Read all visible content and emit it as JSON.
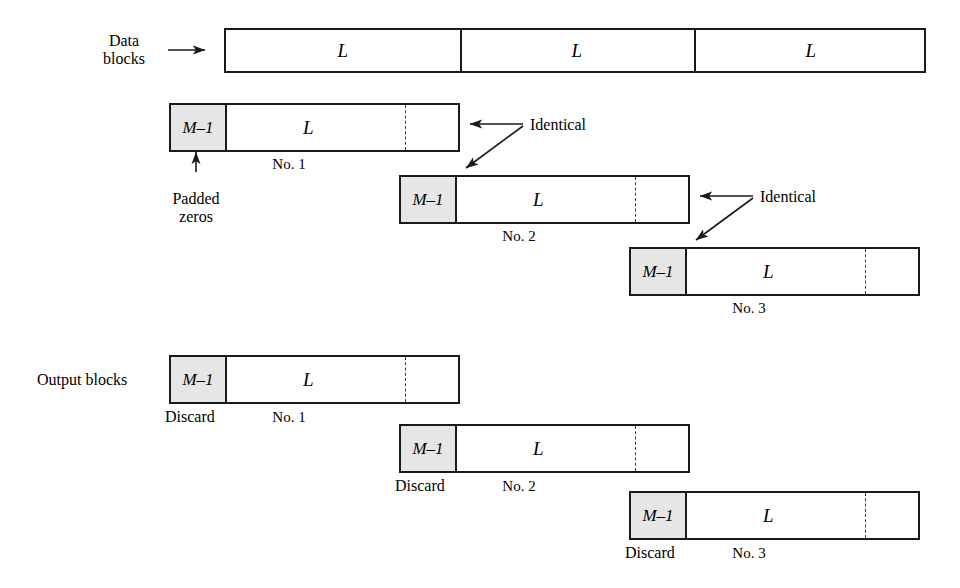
{
  "figure": {
    "labels": {
      "data_blocks": "Data\nblocks",
      "data_blocks_line1": "Data",
      "data_blocks_line2": "blocks",
      "output_blocks": "Output blocks",
      "padded_zeros_line1": "Padded",
      "padded_zeros_line2": "zeros",
      "identical_1": "Identical",
      "identical_2": "Identical",
      "discard_1": "Discard",
      "discard_2": "Discard",
      "discard_3": "Discard"
    },
    "symbols": {
      "L": "L",
      "M_minus_1": "M–1"
    },
    "colors": {
      "shaded_fill": "#e6e6e6",
      "stroke": "#1a1a1a",
      "background": "#ffffff",
      "dashed_stroke": "#3a3a3a"
    },
    "data_row": {
      "name": "data-blocks-row",
      "segments": [
        {
          "label": "L"
        },
        {
          "label": "L"
        },
        {
          "label": "L"
        }
      ]
    },
    "input_blocks": [
      {
        "number": "No. 1",
        "prefix": "M–1",
        "body": "L"
      },
      {
        "number": "No. 2",
        "prefix": "M–1",
        "body": "L"
      },
      {
        "number": "No. 3",
        "prefix": "M–1",
        "body": "L"
      }
    ],
    "output_blocks": [
      {
        "number": "No. 1",
        "prefix": "M–1",
        "body": "L",
        "note": "Discard"
      },
      {
        "number": "No. 2",
        "prefix": "M–1",
        "body": "L",
        "note": "Discard"
      },
      {
        "number": "No. 3",
        "prefix": "M–1",
        "body": "L",
        "note": "Discard"
      }
    ]
  }
}
